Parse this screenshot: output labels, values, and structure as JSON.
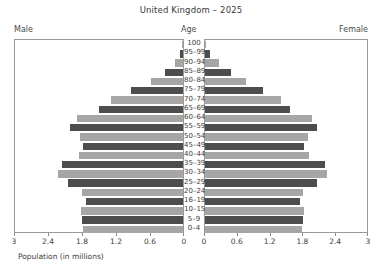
{
  "chart_data": {
    "type": "bar",
    "subtype": "population-pyramid",
    "title": "United Kingdom – 2025",
    "xlabel": "Population (in millions)",
    "ylabel": "Age",
    "grid": false,
    "legend_position": "none",
    "left_header": "Male",
    "right_header": "Female",
    "center_header": "Age",
    "xlim": [
      0,
      3
    ],
    "xticks": [
      3,
      2.4,
      1.8,
      1.2,
      0.6,
      0
    ],
    "xticks_left_labels": [
      "3",
      "2.4",
      "1.8",
      "1.2",
      "0.6",
      "0"
    ],
    "xticks_right_labels": [
      "0",
      "0.6",
      "1.2",
      "1.8",
      "2.4",
      "3"
    ],
    "categories": [
      "100",
      "95–99",
      "90–94",
      "85–89",
      "80–84",
      "75–79",
      "70–74",
      "65–69",
      "60–64",
      "55–59",
      "50–54",
      "45–49",
      "40–44",
      "35–39",
      "30–34",
      "25–29",
      "20–24",
      "16–19",
      "10–15",
      "5–9",
      "0–4"
    ],
    "series": [
      {
        "name": "Male",
        "side": "left",
        "values": [
          0.01,
          0.05,
          0.15,
          0.33,
          0.58,
          0.92,
          1.28,
          1.5,
          1.9,
          2.02,
          1.84,
          1.78,
          1.86,
          2.16,
          2.23,
          2.06,
          1.8,
          1.74,
          1.82,
          1.8,
          1.78
        ]
      },
      {
        "name": "Female",
        "side": "right",
        "values": [
          0.02,
          0.09,
          0.25,
          0.48,
          0.76,
          1.08,
          1.4,
          1.58,
          1.98,
          2.08,
          1.9,
          1.84,
          1.92,
          2.22,
          2.26,
          2.08,
          1.82,
          1.76,
          1.84,
          1.82,
          1.8
        ]
      }
    ],
    "bar_palette": {
      "light": "#a6a6a6",
      "dark": "#4d4d4d"
    },
    "panel_border_color": "#9a9a9a",
    "text_color": "#3d3d3d"
  }
}
